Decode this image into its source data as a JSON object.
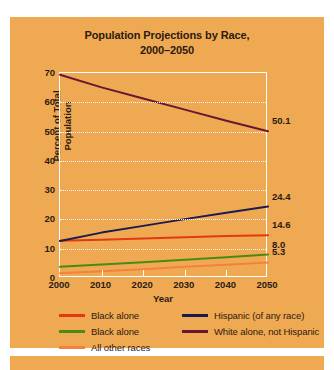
{
  "chart_data": {
    "type": "line",
    "title": "Population Projections by Race, 2000–2050",
    "title_line1": "Population Projections by Race,",
    "title_line2": "2000–2050",
    "xlabel": "Year",
    "ylabel": "Percent of Total Population",
    "x": [
      2000,
      2010,
      2020,
      2030,
      2040,
      2050
    ],
    "xlim": [
      2000,
      2050
    ],
    "ylim": [
      0,
      70
    ],
    "yticks": [
      0,
      10,
      20,
      30,
      40,
      50,
      60,
      70
    ],
    "xticks": [
      2000,
      2010,
      2020,
      2030,
      2040,
      2050
    ],
    "grid": "horizontal-dotted-white",
    "legend_position": "below-plot",
    "series": [
      {
        "name": "Black alone",
        "color": "#e03a10",
        "values": [
          12.7,
          13.1,
          13.5,
          13.9,
          14.3,
          14.6
        ],
        "end_label": "14.6"
      },
      {
        "name": "Black alone",
        "color": "#4a8a14",
        "values": [
          3.8,
          4.6,
          5.4,
          6.2,
          7.1,
          8.0
        ],
        "end_label": "8.0"
      },
      {
        "name": "All other races",
        "color": "#f2823c",
        "values": [
          1.6,
          2.3,
          3.0,
          3.8,
          4.5,
          5.3
        ],
        "end_label": "5.3"
      },
      {
        "name": "Hispanic (of any race)",
        "color": "#1b1b4f",
        "values": [
          12.6,
          15.5,
          17.8,
          20.1,
          22.3,
          24.4
        ],
        "end_label": "24.4"
      },
      {
        "name": "White alone, not Hispanic",
        "color": "#6b1630",
        "values": [
          69.4,
          65.1,
          61.3,
          57.5,
          53.7,
          50.1
        ],
        "end_label": "50.1"
      }
    ],
    "legend": [
      {
        "label": "Black alone",
        "color": "#e03a10"
      },
      {
        "label": "Black alone",
        "color": "#4a8a14"
      },
      {
        "label": "All other races",
        "color": "#f2823c"
      },
      {
        "label": "Hispanic (of any race)",
        "color": "#1b1b4f"
      },
      {
        "label": "White alone, not Hispanic",
        "color": "#6b1630"
      }
    ],
    "colors": {
      "panel_background": "#f0a953",
      "page_background": "#ffffff",
      "grid": "#ffffff",
      "axis_frame": "#ffffff",
      "text": "#2b1b10"
    }
  }
}
